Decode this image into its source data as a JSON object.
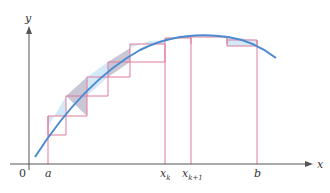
{
  "diagram": {
    "type": "riemann-sum-rectangles",
    "axes": {
      "x_label": "x",
      "y_label": "y",
      "origin_label": "0",
      "axis_color": "#555555"
    },
    "ticks": {
      "a": "a",
      "xk": "x",
      "xk_sub": "k",
      "xk1": "x",
      "xk1_sub": "k+1",
      "b": "b"
    },
    "colors": {
      "curve": "#4a8ad0",
      "rect_stroke": "#e07a9a",
      "fill_light": "#d4e9f8",
      "fill_dark": "#c9c6d6"
    },
    "rects": [
      {
        "x0": 48,
        "x1": 66,
        "top": 116,
        "fill": "light"
      },
      {
        "x0": 66,
        "x1": 87,
        "top": 96,
        "fill": "dark"
      },
      {
        "x0": 87,
        "x1": 108,
        "top": 77,
        "fill": "light"
      },
      {
        "x0": 108,
        "x1": 130,
        "top": 62,
        "fill": "dark"
      },
      {
        "x0": 130,
        "x1": 165,
        "top": 44,
        "fill": "light"
      },
      {
        "x0": 165,
        "x1": 191,
        "top": 38,
        "fill": "dark"
      },
      {
        "x0": 191,
        "x1": 227,
        "top": 37,
        "fill": "light"
      },
      {
        "x0": 227,
        "x1": 257,
        "top": 40,
        "fill": "light"
      }
    ]
  }
}
